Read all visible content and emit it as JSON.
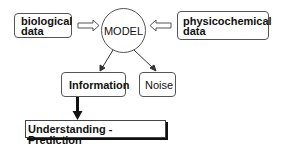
{
  "diagram": {
    "inputs": [
      {
        "id": "biological",
        "line1": "biological",
        "line2": "data"
      },
      {
        "id": "physicochemical",
        "line1": "physicochemical",
        "line2": "data"
      }
    ],
    "model": {
      "label": "MODEL"
    },
    "outputs": [
      {
        "id": "information",
        "label": "Information"
      },
      {
        "id": "noise",
        "label": "Noise"
      }
    ],
    "result": {
      "label": "Understanding - Prediction"
    },
    "colors": {
      "stroke": "#555555",
      "text": "#111111",
      "background": "#ffffff"
    }
  }
}
